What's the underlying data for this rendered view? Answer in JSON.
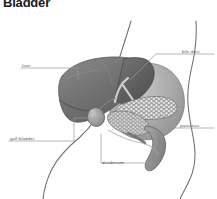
{
  "figure": {
    "title": "Bladder",
    "background_color": "#ffffff"
  },
  "labels": [
    {
      "id": "liver",
      "text": "liver",
      "side": "left"
    },
    {
      "id": "gall",
      "text": "gall bladder",
      "side": "left"
    },
    {
      "id": "bileduct",
      "text": "bile duct",
      "side": "right"
    },
    {
      "id": "pancreas",
      "text": "pancreas",
      "side": "right"
    },
    {
      "id": "duodenum",
      "text": "duodenum",
      "side": "bottom"
    }
  ],
  "colors": {
    "title_text": "#1a1a1a",
    "label_text": "#575757",
    "leader_line": "#8d8d8d",
    "body_outline": "#6e6e6e",
    "liver_dark": "#6a6a6a",
    "liver_mid": "#868686",
    "gall_bladder": "#9a9a9a",
    "pancreas_body": "#a3a3a3",
    "pancreas_stipple": "#efefef",
    "duodenum": "#8f8f8f",
    "bile_duct": "#d8d8d8"
  }
}
